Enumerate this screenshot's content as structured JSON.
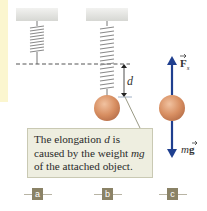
{
  "figure": {
    "panels": [
      {
        "id": "a",
        "label": "a",
        "description": "spring unstretched"
      },
      {
        "id": "b",
        "label": "b",
        "description": "spring stretched by attached object"
      },
      {
        "id": "c",
        "label": "c",
        "description": "free-body diagram of object"
      }
    ],
    "dimension_label": "d",
    "callout": {
      "line1_pre": "The elongation ",
      "line1_var": "d",
      "line1_post": " is",
      "line2_pre": "caused by the weight ",
      "line2_var": "mg",
      "line3": "of the attached object."
    },
    "forces": {
      "spring_force_label": "F",
      "spring_force_sub": "s",
      "weight_label_pre": "m",
      "weight_label_vec": "g"
    },
    "colors": {
      "arrow": "#1f3f8f",
      "ball": "#d88f62",
      "ceiling": "#e3e4e0",
      "callout_bg": "#eeeee0",
      "tag_bg": "#8a8266",
      "sidebar_strip": "#fbf6cf"
    }
  }
}
